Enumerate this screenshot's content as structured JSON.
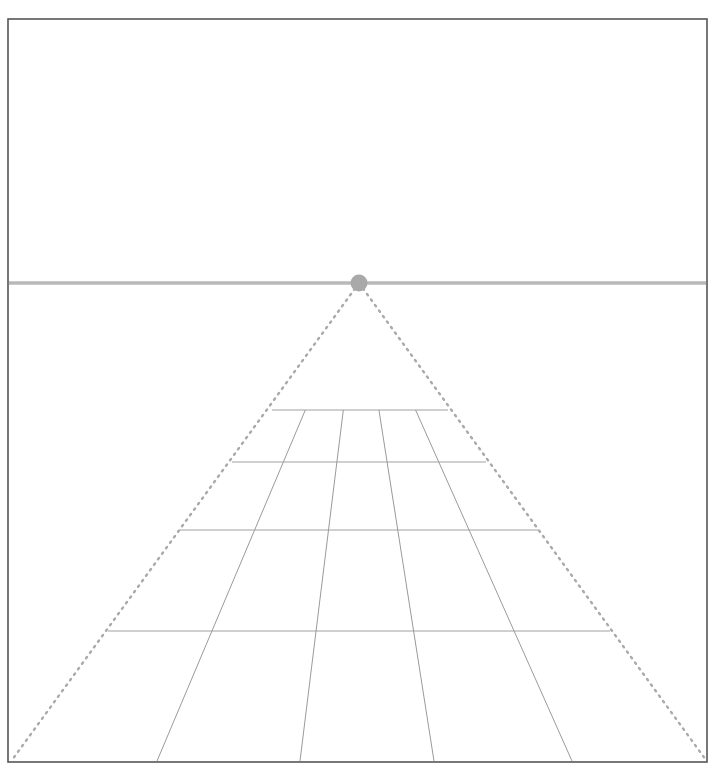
{
  "figure": {
    "width": 718,
    "height": 772,
    "background_color": "#ffffff"
  },
  "frame": {
    "name": "image-border",
    "x": 8,
    "y": 19,
    "width": 699,
    "height": 743,
    "stroke_color": "#555555",
    "stroke_width": 1.6
  },
  "horizon": {
    "label": "horizon line",
    "y": 283,
    "x_start": 9,
    "x_end": 706,
    "stroke_color": "#b9b9b9",
    "stroke_width": 3.4
  },
  "vanishing_point": {
    "label": "vanishing point",
    "cx": 359,
    "cy": 283,
    "radius": 8.5,
    "fill_color": "#a9a9a9"
  },
  "dotted_edges": {
    "label": "dotted perspective edges",
    "stroke_color": "#aaaaaa",
    "stroke_width": 2.4,
    "dash_pattern": "1.6 5.2",
    "lines": [
      {
        "name": "left-dotted-edge",
        "x1": 359,
        "y1": 283,
        "x2": 12,
        "y2": 760
      },
      {
        "name": "right-dotted-edge",
        "x1": 359,
        "y1": 283,
        "x2": 706,
        "y2": 760
      }
    ]
  },
  "orthogonals": {
    "label": "receding orthogonal lines",
    "stroke_color": "#9a9a9a",
    "stroke_width": 1.0,
    "bottom_y": 761,
    "bottom_x_values": [
      157,
      300,
      434,
      572
    ]
  },
  "transversals": {
    "label": "horizontal transversal lines",
    "stroke_color": "#a0a0a0",
    "stroke_width": 1.0,
    "rows": [
      {
        "name": "transversal-row-1",
        "y": 410,
        "x_start": 272,
        "x_end": 448
      },
      {
        "name": "transversal-row-2",
        "y": 462,
        "x_start": 232,
        "x_end": 486
      },
      {
        "name": "transversal-row-3",
        "y": 530,
        "x_start": 180,
        "x_end": 538
      },
      {
        "name": "transversal-row-4",
        "y": 631,
        "x_start": 108,
        "x_end": 610
      }
    ]
  },
  "chart_data": {
    "type": "scatter",
    "xlabel": "",
    "ylabel": "",
    "xlim": [
      0,
      718
    ],
    "ylim": [
      772,
      0
    ],
    "grid": true,
    "legend": "none",
    "annotations": [
      "horizon line at y = 283",
      "vanishing point at (359, 283)",
      "two dotted edge lines from vanishing point to bottom corners",
      "four receding orthogonal lines",
      "four horizontal transversal lines"
    ],
    "series": [
      {
        "name": "horizon",
        "x": [
          9,
          706
        ],
        "y": [
          283,
          283
        ]
      },
      {
        "name": "vanishing-point",
        "x": [
          359
        ],
        "y": [
          283
        ]
      },
      {
        "name": "dotted-left-edge",
        "x": [
          359,
          12
        ],
        "y": [
          283,
          760
        ]
      },
      {
        "name": "dotted-right-edge",
        "x": [
          359,
          706
        ],
        "y": [
          283,
          760
        ]
      },
      {
        "name": "orthogonals-bottom-x",
        "x": [
          157,
          300,
          434,
          572
        ],
        "y": [
          761,
          761,
          761,
          761
        ]
      },
      {
        "name": "transversal-y",
        "x": [
          410,
          462,
          530,
          631
        ],
        "y": [
          410,
          462,
          530,
          631
        ]
      }
    ]
  }
}
